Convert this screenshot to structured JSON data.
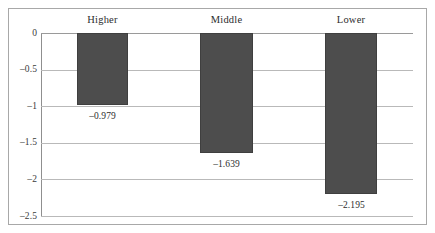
{
  "chart_data": {
    "type": "bar",
    "title": "",
    "subtitle": "",
    "xlabel": "",
    "ylabel": "",
    "categories": [
      "Higher",
      "Middle",
      "Lower"
    ],
    "values": [
      -0.979,
      -1.639,
      -2.195
    ],
    "value_labels": [
      "–0.979",
      "–1.639",
      "–2.195"
    ],
    "ylim": [
      -2.5,
      0
    ],
    "yticks": [
      0,
      -0.5,
      -1,
      -1.5,
      -2,
      -2.5
    ],
    "ytick_labels": [
      "0",
      "–0.5",
      "–1",
      "–1.5",
      "–2",
      "–2.5"
    ],
    "grid": true,
    "grid_axis": "y",
    "legend": false,
    "legend_position": "none",
    "orientation": "vertical",
    "category_label_position": "top",
    "colors": {
      "bar_fill": "#4d4d4d",
      "bar_edge": "#3f3f3f",
      "gridline": "#b9b9b9",
      "axis": "#8f8f8f",
      "frame": "#a8a8a8",
      "text": "#2d2d2d",
      "background": "#ffffff"
    }
  }
}
